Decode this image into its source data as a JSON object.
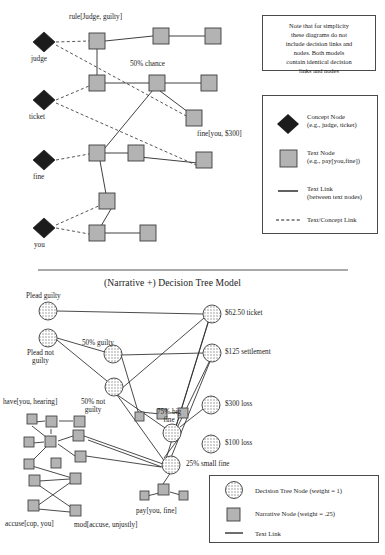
{
  "figure": {
    "note_box": {
      "lines": [
        "Note that for simplicity",
        "these diagrams do not",
        "include decision links and",
        "nodes.  Both models",
        "contain identical decision",
        "links and nodes"
      ]
    },
    "top_panel": {
      "concept_nodes": [
        {
          "label": "judge",
          "x": 44,
          "y": 42
        },
        {
          "label": "ticket",
          "x": 44,
          "y": 100
        },
        {
          "label": "fine",
          "x": 44,
          "y": 160
        },
        {
          "label": "you",
          "x": 44,
          "y": 228
        }
      ],
      "text_nodes": [
        {
          "x": 97,
          "y": 41
        },
        {
          "x": 161,
          "y": 35
        },
        {
          "x": 213,
          "y": 36
        },
        {
          "x": 97,
          "y": 83
        },
        {
          "x": 157,
          "y": 83
        },
        {
          "x": 209,
          "y": 83
        },
        {
          "x": 194,
          "y": 117
        },
        {
          "x": 97,
          "y": 153
        },
        {
          "x": 136,
          "y": 153
        },
        {
          "x": 204,
          "y": 160
        },
        {
          "x": 107,
          "y": 201
        },
        {
          "x": 97,
          "y": 233
        },
        {
          "x": 148,
          "y": 233
        }
      ],
      "annotations": [
        {
          "text": "rule[Judge, guilty]",
          "x": 69,
          "y": 17
        },
        {
          "text": "50% chance",
          "x": 140,
          "y": 62
        },
        {
          "text": "fine[you, $300]",
          "x": 197,
          "y": 134
        }
      ],
      "legend": {
        "items": [
          {
            "icon": "diamond",
            "title": "Concept Node",
            "subtitle": "(e.g., judge, ticket)"
          },
          {
            "icon": "square",
            "title": "Text Node",
            "subtitle": "(e.g., pay[you,fine])"
          },
          {
            "icon": "solid",
            "title": "Text Link",
            "subtitle": "(between text nodes)"
          },
          {
            "icon": "dashed",
            "title": "Text/Concept Link",
            "subtitle": ""
          }
        ]
      }
    },
    "bottom_panel": {
      "title": "(Narrative +) Decision Tree Model",
      "decision_nodes": [
        {
          "label": "Plead guilty",
          "label_pos": "above-left",
          "x": 48,
          "y": 309
        },
        {
          "label": "Plead not\nguilty",
          "label_pos": "below-left",
          "x": 48,
          "y": 336
        },
        {
          "label": "50% guilty",
          "label_pos": "above",
          "x": 112,
          "y": 353
        },
        {
          "label": "50% not\nguilty",
          "label_pos": "below",
          "x": 113,
          "y": 386
        },
        {
          "label": "$62.50 ticket",
          "label_pos": "right",
          "x": 212,
          "y": 314
        },
        {
          "label": "$125 settlement",
          "label_pos": "right",
          "x": 212,
          "y": 353
        },
        {
          "label": "75% big\nfine",
          "label_pos": "left",
          "x": 172,
          "y": 432
        },
        {
          "label": "$300 loss",
          "label_pos": "right",
          "x": 209,
          "y": 404
        },
        {
          "label": "$100 loss",
          "label_pos": "right",
          "x": 209,
          "y": 443
        },
        {
          "label": "25% small fine",
          "label_pos": "right",
          "x": 170,
          "y": 465
        }
      ],
      "narrative_labels": [
        {
          "text": "have[you, hearing]",
          "x": 4,
          "y": 405
        },
        {
          "text": "pay[you, fine]",
          "x": 138,
          "y": 512
        },
        {
          "text": "accuse[cop, you]",
          "x": 6,
          "y": 522
        },
        {
          "text": "mod[accuse, unjustly]",
          "x": 75,
          "y": 523
        }
      ],
      "narrative_nodes": [
        {
          "x": 27,
          "y": 418
        },
        {
          "x": 51,
          "y": 421
        },
        {
          "x": 79,
          "y": 421
        },
        {
          "x": 25,
          "y": 441
        },
        {
          "x": 50,
          "y": 441
        },
        {
          "x": 79,
          "y": 434
        },
        {
          "x": 25,
          "y": 463
        },
        {
          "x": 56,
          "y": 462
        },
        {
          "x": 80,
          "y": 456
        },
        {
          "x": 31,
          "y": 480
        },
        {
          "x": 76,
          "y": 478
        },
        {
          "x": 30,
          "y": 505
        },
        {
          "x": 75,
          "y": 510
        },
        {
          "x": 140,
          "y": 416
        },
        {
          "x": 161,
          "y": 413
        },
        {
          "x": 182,
          "y": 412
        },
        {
          "x": 163,
          "y": 490
        },
        {
          "x": 144,
          "y": 495
        },
        {
          "x": 183,
          "y": 495
        }
      ],
      "legend": {
        "items": [
          {
            "icon": "circle",
            "label": "Decision Tree Node (weight = 1)"
          },
          {
            "icon": "square",
            "label": "Narrative Node (weight = .25)"
          },
          {
            "icon": "line",
            "label": "Text Link"
          }
        ]
      }
    },
    "colors": {
      "concept_node": "#1c1c1c",
      "text_node_fill": "#b3b3b3",
      "node_stroke": "#3d3d3d",
      "link": "#2a2a2a",
      "box_border": "#4a4a4a",
      "text": "#1b1b1b"
    }
  }
}
